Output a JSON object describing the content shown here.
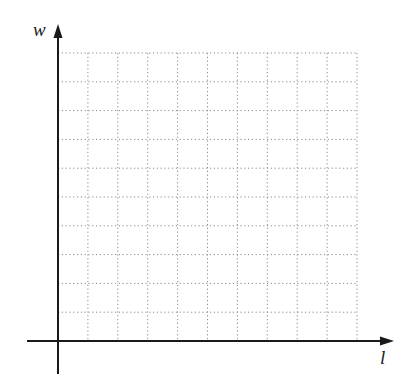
{
  "diagram": {
    "type": "coordinate-grid",
    "x_axis": {
      "label": "l"
    },
    "y_axis": {
      "label": "w"
    },
    "grid": {
      "columns": 10,
      "rows": 10,
      "line_style": "dotted",
      "line_color": "#8a8a8a"
    },
    "axis_color": "#1a1a1a"
  }
}
